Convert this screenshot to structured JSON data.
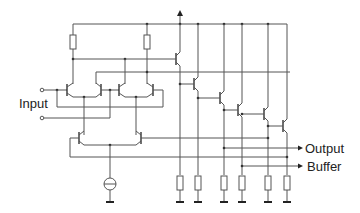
{
  "diagram": {
    "type": "circuit-schematic",
    "labels": {
      "input": "Input",
      "output": "Output",
      "buffer": "Buffer"
    },
    "components": {
      "transistors": 12,
      "resistors_top": 2,
      "resistors_bottom": 6,
      "current_sources": 1,
      "ground_symbols": 7,
      "input_terminals": 2,
      "supply_arrow": 1
    },
    "colors": {
      "wire": "#555555",
      "text": "#222222",
      "background": "#ffffff"
    }
  }
}
